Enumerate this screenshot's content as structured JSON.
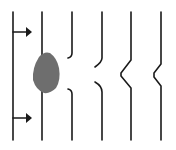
{
  "diagram": {
    "colors": {
      "line": "#1a1a1a",
      "obstacle": "#6e6e6e",
      "background": "#ffffff"
    },
    "arrows": [
      {
        "name": "arrow-top",
        "y": 32
      },
      {
        "name": "arrow-bottom",
        "y": 118
      }
    ],
    "lines": [
      {
        "name": "line-1",
        "x": 13
      },
      {
        "name": "line-2",
        "x": 42
      },
      {
        "name": "line-3",
        "x": 72
      },
      {
        "name": "line-4",
        "x": 102
      },
      {
        "name": "line-5",
        "x": 131
      },
      {
        "name": "line-6",
        "x": 161
      }
    ],
    "obstacle": {
      "name": "gray-blob",
      "cx": 46,
      "cy": 72
    }
  }
}
